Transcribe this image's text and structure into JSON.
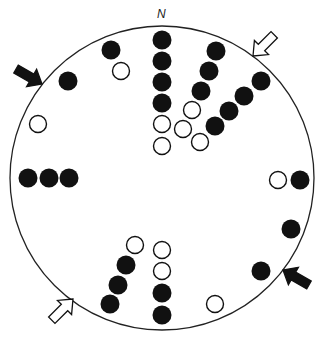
{
  "diagram": {
    "north_label": "N",
    "boundary": {
      "cx": 162,
      "cy": 178,
      "r": 152
    },
    "colors": {
      "filled": "#111111",
      "open_fill": "#ffffff",
      "stroke": "#222222"
    },
    "dot_radius": 9.5,
    "dots": [
      {
        "x": 162,
        "y": 40,
        "filled": true
      },
      {
        "x": 162,
        "y": 61,
        "filled": true
      },
      {
        "x": 162,
        "y": 82,
        "filled": true
      },
      {
        "x": 162,
        "y": 103,
        "filled": true
      },
      {
        "x": 162,
        "y": 124,
        "filled": false
      },
      {
        "x": 162,
        "y": 146,
        "filled": false
      },
      {
        "x": 111,
        "y": 50,
        "filled": true
      },
      {
        "x": 121,
        "y": 71,
        "filled": false
      },
      {
        "x": 68,
        "y": 81,
        "filled": true
      },
      {
        "x": 38,
        "y": 124,
        "filled": false
      },
      {
        "x": 216,
        "y": 51,
        "filled": true
      },
      {
        "x": 209,
        "y": 71,
        "filled": true
      },
      {
        "x": 201,
        "y": 91,
        "filled": true
      },
      {
        "x": 192,
        "y": 110,
        "filled": false
      },
      {
        "x": 183,
        "y": 129,
        "filled": false
      },
      {
        "x": 200,
        "y": 142,
        "filled": false
      },
      {
        "x": 261,
        "y": 81,
        "filled": true
      },
      {
        "x": 244,
        "y": 96,
        "filled": true
      },
      {
        "x": 229,
        "y": 111,
        "filled": true
      },
      {
        "x": 215,
        "y": 126,
        "filled": true
      },
      {
        "x": 28,
        "y": 178,
        "filled": true
      },
      {
        "x": 49,
        "y": 178,
        "filled": true
      },
      {
        "x": 69,
        "y": 178,
        "filled": true
      },
      {
        "x": 278,
        "y": 180,
        "filled": false
      },
      {
        "x": 300,
        "y": 180,
        "filled": true
      },
      {
        "x": 291,
        "y": 229,
        "filled": true
      },
      {
        "x": 261,
        "y": 271,
        "filled": true
      },
      {
        "x": 215,
        "y": 304,
        "filled": false
      },
      {
        "x": 135,
        "y": 245,
        "filled": false
      },
      {
        "x": 126,
        "y": 265,
        "filled": true
      },
      {
        "x": 118,
        "y": 285,
        "filled": true
      },
      {
        "x": 110,
        "y": 304,
        "filled": true
      },
      {
        "x": 162,
        "y": 250,
        "filled": false
      },
      {
        "x": 162,
        "y": 271,
        "filled": false
      },
      {
        "x": 162,
        "y": 293,
        "filled": true
      },
      {
        "x": 162,
        "y": 315,
        "filled": true
      }
    ],
    "arrows": [
      {
        "name": "arrow-northwest-filled",
        "filled": true,
        "tip_x": 42,
        "tip_y": 84,
        "angle_deg": 30
      },
      {
        "name": "arrow-northeast-open",
        "filled": false,
        "tip_x": 253,
        "tip_y": 56,
        "angle_deg": 135
      },
      {
        "name": "arrow-southwest-open",
        "filled": false,
        "tip_x": 73,
        "tip_y": 299,
        "angle_deg": -45
      },
      {
        "name": "arrow-southeast-filled",
        "filled": true,
        "tip_x": 283,
        "tip_y": 270,
        "angle_deg": 210
      }
    ]
  }
}
